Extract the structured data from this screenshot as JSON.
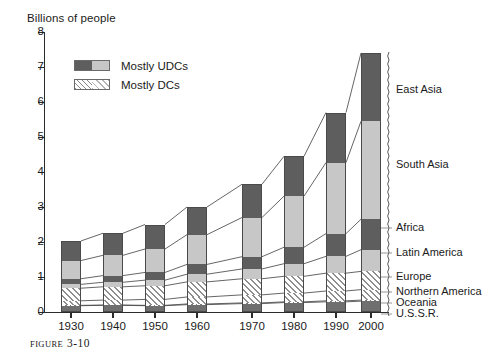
{
  "figure": {
    "caption_prefix": "Figure",
    "caption_number": "3-10"
  },
  "axes": {
    "y_title": "Billions of people",
    "y_ticks": [
      "0",
      "1",
      "2",
      "3",
      "4",
      "5",
      "6",
      "7",
      "8"
    ],
    "x_ticks": [
      "1930",
      "1940",
      "1950",
      "1960",
      "1970",
      "1980",
      "1990",
      "2000"
    ]
  },
  "legend": {
    "items": [
      {
        "label": "Mostly UDCs",
        "pattern": "solid-split-gray"
      },
      {
        "label": "Mostly DCs",
        "pattern": "diagonal-hatch"
      }
    ]
  },
  "region_labels": [
    {
      "name": "East Asia"
    },
    {
      "name": "South Asia"
    },
    {
      "name": "Africa"
    },
    {
      "name": "Latin America"
    },
    {
      "name": "Europe"
    },
    {
      "name": "Northern America"
    },
    {
      "name": "Oceania"
    },
    {
      "name": "U.S.S.R."
    }
  ],
  "chart_data": {
    "type": "bar",
    "stacked": true,
    "title": "",
    "xlabel": "",
    "ylabel": "Billions of people",
    "ylim": [
      0,
      8
    ],
    "ytick_step": 1,
    "grid": false,
    "legend_position": "upper-left-inside",
    "units": "billions of people",
    "categories": [
      "1930",
      "1940",
      "1950",
      "1960",
      "1970",
      "1980",
      "1990",
      "2000"
    ],
    "series": [
      {
        "name": "U.S.S.R.",
        "group": "Mostly DCs",
        "values": [
          0.18,
          0.19,
          0.18,
          0.21,
          0.24,
          0.27,
          0.29,
          0.31
        ]
      },
      {
        "name": "Oceania",
        "group": "Mostly DCs",
        "values": [
          0.01,
          0.01,
          0.01,
          0.02,
          0.02,
          0.02,
          0.03,
          0.03
        ]
      },
      {
        "name": "Northern America",
        "group": "Mostly DCs",
        "values": [
          0.13,
          0.14,
          0.17,
          0.2,
          0.23,
          0.25,
          0.28,
          0.3
        ]
      },
      {
        "name": "Europe",
        "group": "Mostly DCs",
        "values": [
          0.36,
          0.38,
          0.39,
          0.43,
          0.46,
          0.48,
          0.51,
          0.52
        ]
      },
      {
        "name": "Latin America",
        "group": "Mostly UDCs",
        "values": [
          0.11,
          0.13,
          0.16,
          0.22,
          0.28,
          0.36,
          0.48,
          0.62
        ]
      },
      {
        "name": "Africa",
        "group": "Mostly UDCs",
        "values": [
          0.16,
          0.19,
          0.22,
          0.28,
          0.35,
          0.47,
          0.65,
          0.87
        ]
      },
      {
        "name": "South Asia",
        "group": "Mostly UDCs",
        "values": [
          0.52,
          0.58,
          0.67,
          0.85,
          1.12,
          1.46,
          2.03,
          2.8
        ]
      },
      {
        "name": "East Asia",
        "group": "Mostly UDCs",
        "values": [
          0.56,
          0.63,
          0.7,
          0.79,
          0.95,
          1.14,
          1.43,
          1.95
        ]
      }
    ],
    "totals": [
      2.03,
      2.25,
      2.5,
      3.0,
      3.65,
      4.45,
      5.7,
      7.4
    ],
    "colors": {
      "udc_dark": "#5e5e5e",
      "udc_light": "#c7c7c7",
      "dc_hatch": "#8e8e8e",
      "axis": "#2b2b2b"
    }
  }
}
